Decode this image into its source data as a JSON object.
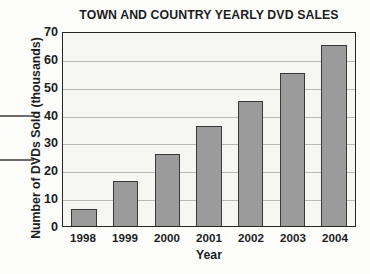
{
  "chart_data": {
    "type": "bar",
    "title": "TOWN AND COUNTRY YEARLY DVD SALES",
    "xlabel": "Year",
    "ylabel": "Number of DVDs Sold (thousands)",
    "categories": [
      "1998",
      "1999",
      "2000",
      "2001",
      "2002",
      "2003",
      "2004"
    ],
    "values": [
      6,
      16,
      26,
      36,
      45,
      55,
      65
    ],
    "ylim": [
      0,
      70
    ],
    "ytick_labels": [
      "0",
      "10",
      "20",
      "30",
      "40",
      "50",
      "60",
      "70"
    ],
    "ytick_values": [
      0,
      10,
      20,
      30,
      40,
      50,
      60,
      70
    ],
    "grid": true,
    "legend": null,
    "colors": {
      "bar_fill": "#9b9b9b",
      "bar_edge": "#3a3a3a",
      "plot_background": "#f6f6f3",
      "gridline": "#b9b9b9",
      "frame": "#262626",
      "text": "#1c1c1c"
    }
  }
}
